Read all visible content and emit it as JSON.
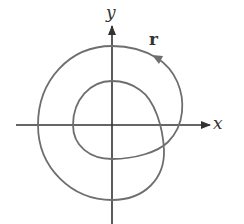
{
  "figure": {
    "axes": {
      "x_label": "x",
      "y_label": "y"
    },
    "curve_label": "r",
    "colors": {
      "curve": "#6e6e6e",
      "axes": "#333333",
      "background": "#ffffff"
    }
  }
}
